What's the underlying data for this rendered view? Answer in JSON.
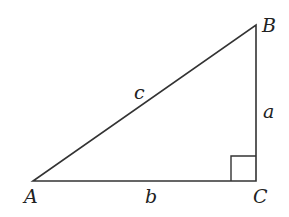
{
  "diagram": {
    "type": "right-triangle",
    "vertices": {
      "A": "A",
      "B": "B",
      "C": "C"
    },
    "sides": {
      "a": "a",
      "b": "b",
      "c": "c"
    },
    "right_angle_at": "C",
    "stroke_color": "#333333"
  }
}
